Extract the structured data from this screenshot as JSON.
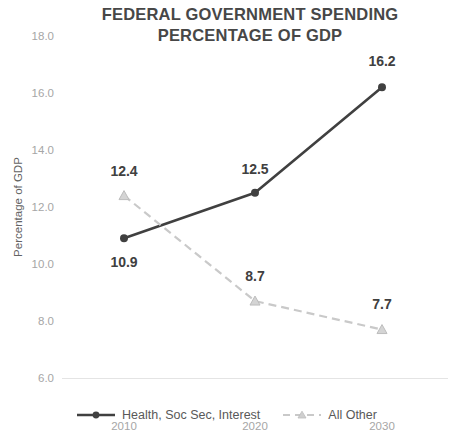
{
  "chart_data": {
    "type": "line",
    "title": "FEDERAL GOVERNMENT SPENDING PERCENTAGE OF GDP",
    "title_lines": [
      "FEDERAL GOVERNMENT SPENDING",
      "PERCENTAGE OF GDP"
    ],
    "xlabel": "",
    "ylabel": "Percentage of GDP",
    "categories": [
      "2010",
      "2020",
      "2030"
    ],
    "x_tick_labels": [
      "2010",
      "2020",
      "2030"
    ],
    "y_tick_labels": [
      "18.0",
      "16.0",
      "14.0",
      "12.0",
      "10.0",
      "8.0",
      "6.0"
    ],
    "y_tick_values": [
      18.0,
      16.0,
      14.0,
      12.0,
      10.0,
      8.0,
      6.0
    ],
    "ylim": [
      6.0,
      18.0
    ],
    "grid": false,
    "legend_position": "bottom",
    "series": [
      {
        "name": "Health, Soc Sec, Interest",
        "values": [
          10.9,
          12.5,
          16.2
        ],
        "point_labels": [
          "10.9",
          "12.5",
          "16.2"
        ],
        "color": "#404040",
        "line_style": "solid",
        "marker": "circle"
      },
      {
        "name": "All Other",
        "values": [
          12.4,
          8.7,
          7.7
        ],
        "point_labels": [
          "12.4",
          "8.7",
          "7.7"
        ],
        "color": "#c9c9c9",
        "line_style": "dashed",
        "marker": "triangle"
      }
    ]
  },
  "colors": {
    "title": "#474747",
    "tick_label": "#a6a6a6",
    "axis_title": "#636363",
    "baseline": "#e4e4e4",
    "data_label": "#404040",
    "series_primary": "#404040",
    "series_secondary": "#c9c9c9",
    "legend_label": "#595959",
    "background": "#ffffff"
  }
}
